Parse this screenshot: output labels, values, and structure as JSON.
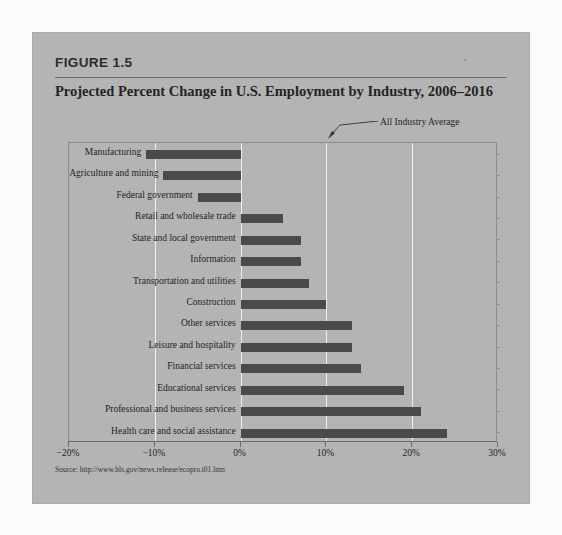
{
  "figure": {
    "number": "FIGURE 1.5",
    "title": "Projected Percent Change in U.S. Employment by Industry, 2006–2016",
    "source": "Source: http://www.bls.gov/news.release/ecopro.t01.htm",
    "annotation": "All Industry Average",
    "panel_color": "#b4b4b4",
    "bar_color": "#4a4a4a",
    "gridline_color": "#eeeeee"
  },
  "chart_data": {
    "type": "bar",
    "orientation": "horizontal",
    "title": "Projected Percent Change in U.S. Employment by Industry, 2006–2016",
    "xlabel": "",
    "ylabel": "",
    "xlim": [
      -20,
      30
    ],
    "xticks": [
      -20,
      -10,
      0,
      10,
      20,
      30
    ],
    "xtick_labels": [
      "−20%",
      "−10%",
      "0%",
      "10%",
      "20%",
      "30%"
    ],
    "grid": true,
    "legend": false,
    "annotations": [
      {
        "text": "All Industry Average",
        "points_to_x": 10,
        "note": "arrow to 10% gridline"
      }
    ],
    "categories": [
      "Manufacturing",
      "Agriculture and mining",
      "Federal government",
      "Retail and wholesale trade",
      "State and local government",
      "Information",
      "Transportation and utilities",
      "Construction",
      "Other services",
      "Leisure and hospitality",
      "Financial services",
      "Educational services",
      "Professional and business services",
      "Health care and social assistance"
    ],
    "values": [
      -11,
      -9,
      -5,
      5,
      7,
      7,
      8,
      10,
      13,
      13,
      14,
      19,
      21,
      24
    ]
  }
}
